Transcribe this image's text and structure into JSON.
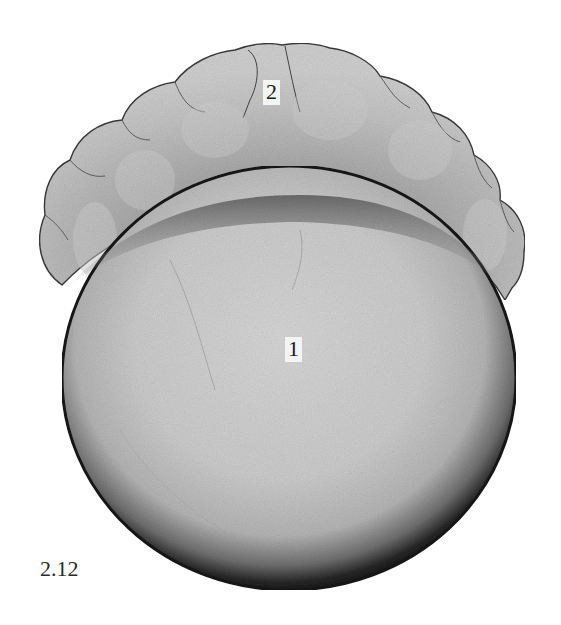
{
  "figure": {
    "number": "2.12",
    "type": "micrograph",
    "labels": [
      {
        "id": "2",
        "text": "2",
        "structure": "blastoderm"
      },
      {
        "id": "1",
        "text": "1",
        "structure": "yolk"
      }
    ]
  },
  "colors": {
    "background": "#ffffff",
    "yolk_fill": "#c9c9c9",
    "yolk_rim": "#1c1c1c",
    "blastoderm_fill": "#b8b8b8",
    "blastoderm_edge": "#3a3a3a",
    "label_box": "#f4f4f4"
  }
}
